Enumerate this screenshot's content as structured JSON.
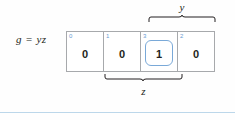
{
  "figure": {
    "equation": "g = yz",
    "kmap": {
      "cells": [
        {
          "index": "0",
          "value": "0",
          "grouped": false
        },
        {
          "index": "1",
          "value": "0",
          "grouped": false
        },
        {
          "index": "3",
          "value": "1",
          "grouped": true
        },
        {
          "index": "2",
          "value": "0",
          "grouped": false
        }
      ]
    },
    "braces": [
      {
        "id": "y",
        "label": "y",
        "position": "top",
        "spans_cells": [
          "3",
          "2"
        ]
      },
      {
        "id": "z",
        "label": "z",
        "position": "bottom",
        "spans_cells": [
          "1",
          "3"
        ]
      }
    ],
    "colors": {
      "grid_line": "#a7a9ac",
      "index_text": "#6b9bd2",
      "group_outline": "#7aa9d8",
      "text": "#231f20",
      "footer_rule": "#bcd7ea",
      "background": "#fefefe"
    }
  }
}
